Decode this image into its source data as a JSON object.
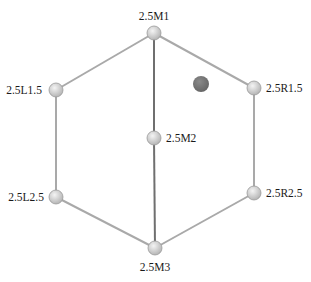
{
  "diagram": {
    "type": "graph",
    "nodes": [
      {
        "id": "M1",
        "label": "2.5M1",
        "x": 154,
        "y": 33,
        "label_x": 154,
        "label_y": 20,
        "anchor": "middle"
      },
      {
        "id": "L1.5",
        "label": "2.5L1.5",
        "x": 56,
        "y": 90,
        "label_x": 42,
        "label_y": 94,
        "anchor": "end"
      },
      {
        "id": "R1.5",
        "label": "2.5R1.5",
        "x": 254,
        "y": 88,
        "label_x": 266,
        "label_y": 92,
        "anchor": "start"
      },
      {
        "id": "M2",
        "label": "2.5M2",
        "x": 154,
        "y": 138,
        "label_x": 166,
        "label_y": 142,
        "anchor": "start"
      },
      {
        "id": "L2.5",
        "label": "2.5L2.5",
        "x": 56,
        "y": 197,
        "label_x": 44,
        "label_y": 201,
        "anchor": "end"
      },
      {
        "id": "R2.5",
        "label": "2.5R2.5",
        "x": 254,
        "y": 193,
        "label_x": 266,
        "label_y": 197,
        "anchor": "start"
      },
      {
        "id": "M3",
        "label": "2.5M3",
        "x": 155,
        "y": 248,
        "label_x": 155,
        "label_y": 271,
        "anchor": "middle"
      }
    ],
    "edges": [
      {
        "from": "M1",
        "to": "L1.5",
        "style": "light"
      },
      {
        "from": "M1",
        "to": "R1.5",
        "style": "light"
      },
      {
        "from": "M1",
        "to": "M2",
        "style": "dark"
      },
      {
        "from": "M2",
        "to": "M3",
        "style": "dark"
      },
      {
        "from": "L1.5",
        "to": "L2.5",
        "style": "light"
      },
      {
        "from": "R1.5",
        "to": "R2.5",
        "style": "light"
      },
      {
        "from": "L2.5",
        "to": "M3",
        "style": "light"
      },
      {
        "from": "R2.5",
        "to": "M3",
        "style": "light"
      }
    ],
    "marker": {
      "label": "",
      "x": 201,
      "y": 84,
      "r": 8,
      "color": "#7a7a7a"
    },
    "node_radius": 7,
    "colors": {
      "node_fill_center": "#f2f2f2",
      "node_fill_edge": "#b8b8b8",
      "node_stroke": "#9a9a9a",
      "edge_light": "#a9a9a9",
      "edge_dark": "#6f6f6f",
      "marker": "#7a7a7a",
      "label": "#1a1a1a"
    }
  }
}
